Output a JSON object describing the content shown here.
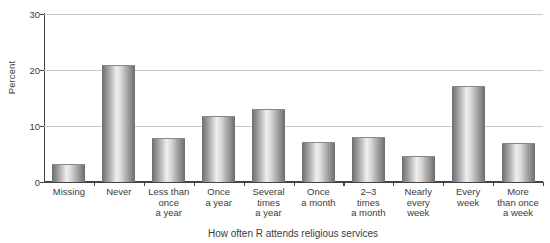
{
  "chart_data": {
    "type": "bar",
    "title": "",
    "xlabel": "How often R attends religious services",
    "ylabel": "Percent",
    "ylim": [
      0,
      30
    ],
    "yticks": [
      0,
      10,
      20,
      30
    ],
    "grid": true,
    "legend": false,
    "categories": [
      "Missing",
      "Never",
      "Less than once a year",
      "Once a year",
      "Several times a year",
      "Once a month",
      "2–3 times a month",
      "Nearly every week",
      "Every week",
      "More than once a week"
    ],
    "category_lines": [
      [
        "Missing"
      ],
      [
        "Never"
      ],
      [
        "Less than",
        "once",
        "a year"
      ],
      [
        "Once",
        "a year"
      ],
      [
        "Several",
        "times",
        "a year"
      ],
      [
        "Once",
        "a month"
      ],
      [
        "2–3",
        "times",
        "a month"
      ],
      [
        "Nearly",
        "every",
        "week"
      ],
      [
        "Every",
        "week"
      ],
      [
        "More",
        "than once",
        "a week"
      ]
    ],
    "values": [
      3.0,
      20.7,
      7.7,
      11.6,
      12.8,
      6.9,
      7.8,
      4.4,
      17.0,
      6.7
    ],
    "bar_color": "#aaaaaa",
    "axis_color": "#444444",
    "grid_color": "#c9c9c9"
  }
}
